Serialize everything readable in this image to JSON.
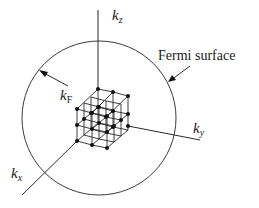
{
  "figure": {
    "type": "Fermi sphere in reciprocal (k) space",
    "labels": {
      "kz": {
        "main": "k",
        "sub": "z"
      },
      "ky": {
        "main": "k",
        "sub": "y"
      },
      "kx": {
        "main": "k",
        "sub": "x"
      },
      "kF": {
        "main": "k",
        "sub": "F"
      },
      "fermi_surface": "Fermi surface"
    },
    "colors": {
      "line": "#2a2a2a",
      "point": "#111111",
      "background": "#ffffff"
    }
  }
}
